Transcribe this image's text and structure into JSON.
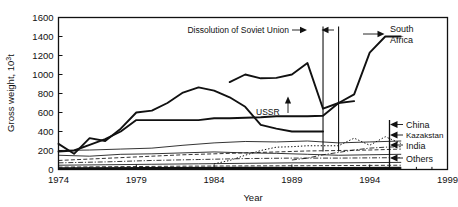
{
  "chart_data": {
    "type": "line",
    "title": "",
    "xlabel": "Year",
    "ylabel": "Gross weight, 10³t",
    "xlim": [
      1974,
      1999
    ],
    "ylim": [
      0,
      1600
    ],
    "xticks": [
      1974,
      1979,
      1984,
      1989,
      1994,
      1999
    ],
    "yticks": [
      0,
      200,
      400,
      600,
      800,
      1000,
      1200,
      1400,
      1600
    ],
    "grid": false,
    "legend_position": "right-inline-arrows",
    "data_x_range": [
      1974,
      1996
    ],
    "series": [
      {
        "name": "South Africa",
        "style": "bold-solid",
        "label_side": "right",
        "x": [
          1974,
          1975,
          1976,
          1977,
          1978,
          1979,
          1980,
          1981,
          1982,
          1983,
          1984,
          1985,
          1986,
          1987,
          1988,
          1989,
          1990,
          1991,
          1992,
          1993,
          1994,
          1995,
          1996
        ],
        "values": [
          190,
          200,
          260,
          320,
          400,
          520,
          520,
          520,
          520,
          520,
          540,
          540,
          545,
          550,
          560,
          560,
          560,
          565,
          700,
          790,
          1230,
          1400,
          1400
        ]
      },
      {
        "name": "USSR",
        "style": "bold-solid",
        "label_side": "inline",
        "x": [
          1974,
          1975,
          1976,
          1977,
          1978,
          1979,
          1980,
          1981,
          1982,
          1983,
          1984,
          1985,
          1986,
          1987,
          1988,
          1989,
          1990,
          1991
        ],
        "values": [
          270,
          165,
          330,
          300,
          430,
          600,
          620,
          700,
          810,
          865,
          830,
          760,
          660,
          470,
          430,
          400,
          400,
          400
        ]
      },
      {
        "name": "Russia",
        "style": "bold-solid",
        "label_side": "none",
        "x": [
          1985,
          1986,
          1987,
          1988,
          1989,
          1990,
          1991,
          1992,
          1993
        ],
        "values": [
          920,
          1000,
          960,
          965,
          1000,
          1120,
          640,
          700,
          720
        ]
      },
      {
        "name": "China",
        "style": "dotted",
        "label_side": "right",
        "x": [
          1984,
          1985,
          1986,
          1987,
          1988,
          1989,
          1990,
          1991,
          1992,
          1993,
          1994,
          1995,
          1996
        ],
        "values": [
          60,
          95,
          150,
          200,
          235,
          240,
          250,
          250,
          250,
          330,
          255,
          345,
          275
        ]
      },
      {
        "name": "Kazakstan",
        "style": "dashdot",
        "label_side": "right",
        "x": [
          1989,
          1990,
          1991,
          1992,
          1993,
          1994,
          1995,
          1996
        ],
        "values": [
          100,
          120,
          155,
          180,
          205,
          225,
          235,
          240
        ]
      },
      {
        "name": "India",
        "style": "dashed",
        "label_side": "right",
        "x": [
          1974,
          1976,
          1978,
          1980,
          1982,
          1984,
          1986,
          1988,
          1990,
          1992,
          1994,
          1996
        ],
        "values": [
          95,
          110,
          125,
          140,
          155,
          165,
          175,
          185,
          195,
          200,
          205,
          215
        ]
      },
      {
        "name": "Others",
        "style": "thin-solid",
        "label_side": "right",
        "x": [
          1974,
          1976,
          1978,
          1980,
          1982,
          1984,
          1986,
          1988,
          1990,
          1992,
          1994,
          1996
        ],
        "values": [
          200,
          205,
          215,
          225,
          255,
          280,
          295,
          290,
          300,
          280,
          290,
          300
        ]
      },
      {
        "name": "minor-1",
        "style": "thin-solid",
        "label_side": "none",
        "x": [
          1974,
          1976,
          1978,
          1980,
          1982,
          1984,
          1986,
          1988,
          1990,
          1992,
          1994,
          1996
        ],
        "values": [
          150,
          140,
          160,
          165,
          175,
          185,
          175,
          170,
          160,
          150,
          155,
          160
        ]
      },
      {
        "name": "minor-2",
        "style": "dashdot",
        "label_side": "none",
        "x": [
          1974,
          1977,
          1980,
          1983,
          1986,
          1989,
          1992,
          1996
        ],
        "values": [
          70,
          80,
          95,
          105,
          115,
          120,
          120,
          125
        ]
      },
      {
        "name": "minor-3",
        "style": "thin-solid",
        "label_side": "none",
        "x": [
          1974,
          1977,
          1980,
          1983,
          1986,
          1989,
          1992,
          1996
        ],
        "values": [
          45,
          50,
          55,
          60,
          65,
          70,
          70,
          75
        ]
      },
      {
        "name": "minor-4",
        "style": "dashed",
        "label_side": "none",
        "x": [
          1974,
          1978,
          1982,
          1986,
          1990,
          1993,
          1996
        ],
        "values": [
          25,
          30,
          35,
          38,
          40,
          42,
          45
        ]
      },
      {
        "name": "baseline",
        "style": "thick-bottom",
        "label_side": "none",
        "x": [
          1974,
          1980,
          1986,
          1992,
          1996
        ],
        "values": [
          12,
          14,
          15,
          14,
          15
        ]
      }
    ],
    "annotations": [
      {
        "name": "dissolution-of-soviet-union",
        "text": "Dissolution of Soviet Union",
        "points_to_years": [
          1991,
          1992
        ]
      },
      {
        "name": "ussr-pointer",
        "text": "USSR",
        "points_to_year": 1990
      }
    ],
    "vertical_markers": [
      1991,
      1992
    ]
  },
  "labels": {
    "south_africa": "South Africa",
    "china": "China",
    "kazakstan": "Kazakstan",
    "india": "India",
    "others": "Others",
    "ussr": "USSR",
    "dissolution": "Dissolution of Soviet Union"
  },
  "axes": {
    "y_title": "Gross weight, 10³t",
    "y_title_main": "Gross weight, 10",
    "y_title_exp": "3",
    "y_title_unit": "t",
    "x_title": "Year",
    "y_ticks": [
      "1600",
      "1400",
      "1200",
      "1000",
      "800",
      "600",
      "400",
      "200",
      "0"
    ],
    "x_ticks": [
      "1974",
      "1979",
      "1984",
      "1989",
      "1994",
      "1999"
    ]
  }
}
